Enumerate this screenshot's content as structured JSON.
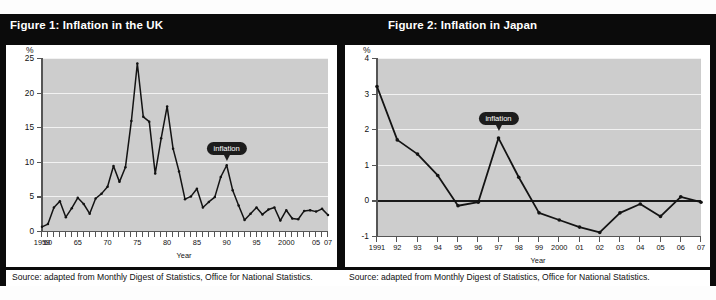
{
  "figures": [
    {
      "title": "Figure 1: Inflation in the UK",
      "source": "Source: adapted from Monthly Digest of Statistics, Office for National Statistics.",
      "callout": "inflation"
    },
    {
      "title": "Figure 2:  Inflation in Japan",
      "source": "Source: adapted from Monthly Digest of Statistics, Office for National Statistics.",
      "callout": "inflation"
    }
  ],
  "chart_data": [
    {
      "type": "line",
      "title": "Figure 1: Inflation in the UK",
      "xlabel": "Year",
      "ylabel": "%",
      "ylim": [
        0,
        25
      ],
      "yticks": [
        0,
        5,
        10,
        15,
        20,
        25
      ],
      "xlim": [
        1959,
        2007
      ],
      "xticks": [
        1959,
        1960,
        1965,
        1970,
        1975,
        1980,
        1985,
        1990,
        1995,
        2000,
        2005,
        2007
      ],
      "xticklabels": [
        "1959",
        "60",
        "65",
        "70",
        "75",
        "80",
        "85",
        "90",
        "95",
        "2000",
        "05",
        "07"
      ],
      "grid": true,
      "legend": false,
      "annotation": "inflation",
      "annotation_x": 1990,
      "annotation_y": 9.5,
      "x": [
        1959,
        1960,
        1961,
        1962,
        1963,
        1964,
        1965,
        1966,
        1967,
        1968,
        1969,
        1970,
        1971,
        1972,
        1973,
        1974,
        1975,
        1976,
        1977,
        1978,
        1979,
        1980,
        1981,
        1982,
        1983,
        1984,
        1985,
        1986,
        1987,
        1988,
        1989,
        1990,
        1991,
        1992,
        1993,
        1994,
        1995,
        1996,
        1997,
        1998,
        1999,
        2000,
        2001,
        2002,
        2003,
        2004,
        2005,
        2006,
        2007
      ],
      "values": [
        0.6,
        1.0,
        3.4,
        4.3,
        2.0,
        3.3,
        4.8,
        3.9,
        2.5,
        4.7,
        5.4,
        6.4,
        9.4,
        7.1,
        9.2,
        15.9,
        24.2,
        16.5,
        15.8,
        8.3,
        13.4,
        18.0,
        11.9,
        8.6,
        4.6,
        5.0,
        6.1,
        3.4,
        4.2,
        4.9,
        7.8,
        9.5,
        5.9,
        3.7,
        1.6,
        2.5,
        3.4,
        2.4,
        3.1,
        3.4,
        1.5,
        3.0,
        1.8,
        1.7,
        2.9,
        3.0,
        2.8,
        3.2,
        2.3
      ]
    },
    {
      "type": "line",
      "title": "Figure 2:  Inflation in Japan",
      "xlabel": "Year",
      "ylabel": "%",
      "ylim": [
        -1,
        4
      ],
      "yticks": [
        -1,
        0,
        1,
        2,
        3,
        4
      ],
      "xlim": [
        1991,
        2007
      ],
      "xticks": [
        1991,
        1992,
        1993,
        1994,
        1995,
        1996,
        1997,
        1998,
        1999,
        2000,
        2001,
        2002,
        2003,
        2004,
        2005,
        2006,
        2007
      ],
      "xticklabels": [
        "1991",
        "92",
        "93",
        "94",
        "95",
        "96",
        "97",
        "98",
        "99",
        "2000",
        "01",
        "02",
        "03",
        "04",
        "05",
        "06",
        "07"
      ],
      "grid": true,
      "legend": false,
      "annotation": "inflation",
      "annotation_x": 1997,
      "annotation_y": 1.75,
      "x": [
        1991,
        1992,
        1993,
        1994,
        1995,
        1996,
        1997,
        1998,
        1999,
        2000,
        2001,
        2002,
        2003,
        2004,
        2005,
        2006,
        2007
      ],
      "values": [
        3.2,
        1.7,
        1.3,
        0.7,
        -0.15,
        -0.05,
        1.75,
        0.65,
        -0.35,
        -0.55,
        -0.75,
        -0.9,
        -0.35,
        -0.1,
        -0.45,
        0.1,
        -0.05
      ]
    }
  ]
}
